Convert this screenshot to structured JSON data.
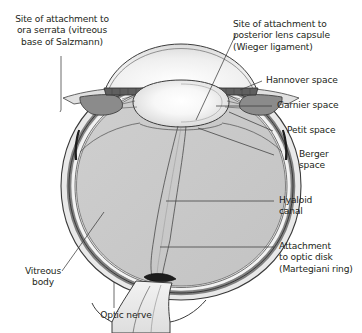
{
  "figure": {
    "type": "anatomical-cross-section",
    "width": 362,
    "height": 333,
    "background_color": "#ffffff"
  },
  "labels": {
    "ora_serrata": "Site of attachment to\nora serrata (vitreous\nbase of Salzmann)",
    "posterior_lens_capsule": "Site of attachment to\nposterior lens capsule\n(Wieger ligament)",
    "hannover_space": "Hannover space",
    "garnier_space": "Garnier space",
    "petit_space": "Petit space",
    "berger_space": "Berger\nspace",
    "hyaloid_canal": "Hyaloid\ncanal",
    "attachment_optic_disk": "Attachment\nto optic disk\n(Martegiani ring)",
    "vitreous_body": "Vitreous\nbody",
    "optic_nerve": "Optic nerve"
  },
  "colors": {
    "text": "#231f20",
    "leader_line": "#3c3c3c",
    "outline": "#333333",
    "sclera_fill": "#e8e8e8",
    "choroid_fill": "#9a9a9a",
    "retina_fill": "#f2f2f2",
    "vitreous_fill": "#c9c9c9",
    "lens_fill": "#ffffff",
    "cornea_fill": "#f0f0f0",
    "iris_fill": "#6e6e6e",
    "ciliary_fill": "#8a8a8a",
    "optic_nerve_fill": "#ededed"
  },
  "structures": [
    {
      "name": "cornea",
      "label": "Cornea"
    },
    {
      "name": "anterior-chamber",
      "label": "Anterior chamber"
    },
    {
      "name": "iris",
      "label": "Iris"
    },
    {
      "name": "lens",
      "label": "Lens"
    },
    {
      "name": "ciliary-body",
      "label": "Ciliary body"
    },
    {
      "name": "zonular-fibers",
      "label": "Zonular fibers"
    },
    {
      "name": "sclera",
      "label": "Sclera"
    },
    {
      "name": "choroid",
      "label": "Choroid"
    },
    {
      "name": "retina",
      "label": "Retina"
    },
    {
      "name": "vitreous-body",
      "label": "Vitreous body"
    },
    {
      "name": "hyaloid-canal",
      "label": "Hyaloid canal"
    },
    {
      "name": "optic-nerve",
      "label": "Optic nerve"
    },
    {
      "name": "optic-disk",
      "label": "Optic disk"
    }
  ]
}
